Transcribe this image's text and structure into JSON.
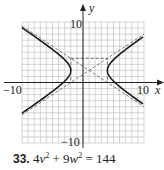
{
  "figure": {
    "x_axis_label": "x",
    "y_axis_label": "y",
    "x_range": [
      -10,
      10
    ],
    "y_range": [
      -10,
      10
    ],
    "grid_step": 1,
    "tick_labels": {
      "x_min": "−10",
      "x_max": "10",
      "y_min": "−10",
      "y_max": "10"
    },
    "hyperbola": {
      "equation": "(x−1)^2/9 − (y−2)^2/4 = 1",
      "center": [
        1,
        2
      ],
      "a": 3,
      "b": 2,
      "orientation": "horizontal"
    },
    "asymptote_box": {
      "x": [
        -2,
        4
      ],
      "y": [
        0,
        4
      ]
    },
    "colors": {
      "grid": "#b8b8b8",
      "axis": "#222222",
      "curve": "#1a1a1a",
      "dashed": "#555555"
    }
  },
  "caption": {
    "number": "33.",
    "coef1": "4",
    "var1": "v",
    "exp1": "2",
    "plus": " + ",
    "coef2": "9",
    "var2": "w",
    "exp2": "2",
    "equals": " = ",
    "rhs": "144"
  }
}
